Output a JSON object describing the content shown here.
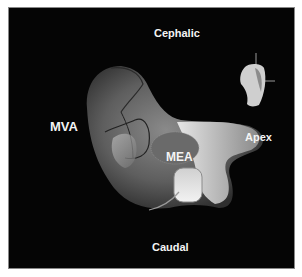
{
  "figure": {
    "background_color": "#050505",
    "labels": {
      "top": "Cephalic",
      "bottom": "Caudal",
      "left": "MVA",
      "right": "Apex",
      "center": "MEA"
    },
    "objects": [
      {
        "name": "heart-model-3d",
        "description": "grayscale 3D rendered cardiac chamber surface"
      },
      {
        "name": "orientation-inset",
        "description": "small heart model with axis lines, top right"
      }
    ]
  }
}
